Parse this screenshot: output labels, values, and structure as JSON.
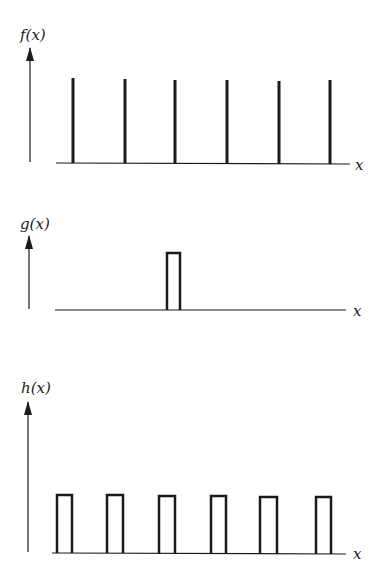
{
  "diagram": {
    "panels": [
      {
        "id": "f",
        "ylabel": "f(x)",
        "xlabel": "x",
        "kind": "impulse-train",
        "positions": [
          73,
          125,
          175,
          227,
          279,
          330
        ],
        "baseline_y": 163,
        "top_y": 78
      },
      {
        "id": "g",
        "ylabel": "g(x)",
        "xlabel": "x",
        "kind": "single-rect-pulse",
        "pulses": [
          [
            167,
            180
          ]
        ],
        "baseline_y": 310,
        "top_y": 252
      },
      {
        "id": "h",
        "ylabel": "h(x)",
        "xlabel": "x",
        "kind": "rect-pulse-train",
        "pulses": [
          [
            57,
            72
          ],
          [
            107,
            122
          ],
          [
            159,
            175
          ],
          [
            211,
            226
          ],
          [
            261,
            277
          ],
          [
            316,
            331
          ]
        ],
        "baseline_y": 553,
        "top_y": 495
      }
    ],
    "line_color": "#1a1a1a"
  }
}
